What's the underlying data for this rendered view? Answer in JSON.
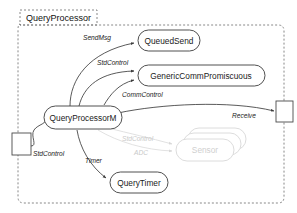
{
  "diagram": {
    "title": "QueryProcessor",
    "type": "component-wiring-diagram",
    "components": [
      {
        "id": "queryProcessorM",
        "label": "QueryProcessorM",
        "faded": false
      },
      {
        "id": "queuedSend",
        "label": "QueuedSend",
        "faded": false
      },
      {
        "id": "genericCommPromiscuous",
        "label": "GenericCommPromiscuous",
        "faded": false
      },
      {
        "id": "queryTimer",
        "label": "QueryTimer",
        "faded": false
      },
      {
        "id": "sensor",
        "label": "Sensor",
        "faded": true
      }
    ],
    "ports": [
      {
        "id": "port-left",
        "side": "left"
      },
      {
        "id": "port-right",
        "side": "right"
      }
    ],
    "connections": [
      {
        "id": "sendmsg",
        "label": "SendMsg",
        "from": "queryProcessorM",
        "to": "queuedSend",
        "faded": false
      },
      {
        "id": "stdcontrol-comm",
        "label": "StdControl",
        "from": "queryProcessorM",
        "to": "genericCommPromiscuous",
        "faded": false
      },
      {
        "id": "commcontrol",
        "label": "CommControl",
        "from": "queryProcessorM",
        "to": "genericCommPromiscuous",
        "faded": false
      },
      {
        "id": "receive",
        "label": "Receive",
        "from": "queryProcessorM",
        "to": "port-right",
        "faded": false
      },
      {
        "id": "stdcontrol-ext",
        "label": "StdControl",
        "from": "port-left",
        "to": "queryProcessorM",
        "faded": false
      },
      {
        "id": "timer",
        "label": "Timer",
        "from": "queryProcessorM",
        "to": "queryTimer",
        "faded": false
      },
      {
        "id": "stdcontrol-sensor",
        "label": "StdControl",
        "from": "queryProcessorM",
        "to": "sensor",
        "faded": true
      },
      {
        "id": "adc",
        "label": "ADC",
        "from": "queryProcessorM",
        "to": "sensor",
        "faded": true
      }
    ],
    "colors": {
      "background": "#ffffff",
      "stroke": "#3c3c3c",
      "boundary": "#7a7a7a",
      "faded": "#d8d8d8",
      "text": "#1a1a1a"
    }
  }
}
